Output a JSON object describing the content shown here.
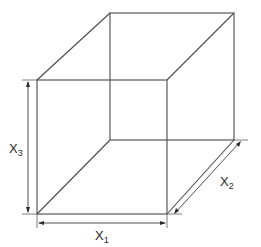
{
  "diagram": {
    "type": "rectangular-box-dimensions",
    "labels": {
      "x1": {
        "base": "X",
        "subscript": "1"
      },
      "x2": {
        "base": "X",
        "subscript": "2"
      },
      "x3": {
        "base": "X",
        "subscript": "3"
      }
    },
    "colors": {
      "line": "#4a4a4a",
      "text": "#2a2a2a",
      "background": "#ffffff"
    }
  }
}
